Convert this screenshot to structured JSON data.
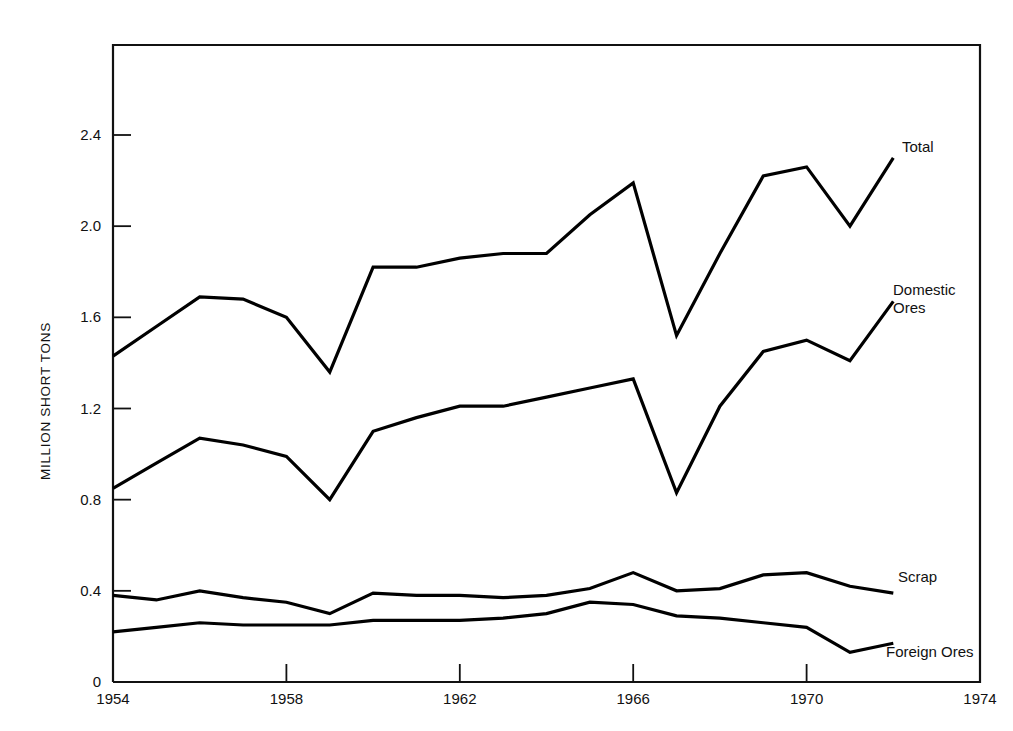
{
  "chart_data": {
    "type": "line",
    "title": "",
    "subtitle": "",
    "xlabel": "",
    "ylabel": "MILLION SHORT TONS",
    "xlim": [
      1954,
      1974
    ],
    "ylim": [
      0,
      2.65
    ],
    "grid": false,
    "legend_position": "right-inline",
    "x_ticks": [
      "1954",
      "1958",
      "1962",
      "1966",
      "1970",
      "1974"
    ],
    "x_tick_values": [
      1954,
      1958,
      1962,
      1966,
      1970,
      1974
    ],
    "y_ticks": [
      "0",
      "0.4",
      "0.8",
      "1.2",
      "1.6",
      "2.0",
      "2.4"
    ],
    "y_tick_values": [
      0,
      0.4,
      0.8,
      1.2,
      1.6,
      2.0,
      2.4
    ],
    "x": [
      1954,
      1955,
      1956,
      1957,
      1958,
      1959,
      1960,
      1961,
      1962,
      1963,
      1964,
      1965,
      1966,
      1967,
      1968,
      1969,
      1970,
      1971,
      1972
    ],
    "series": [
      {
        "name": "Total",
        "label": "Total",
        "color": "#000000",
        "values": [
          1.43,
          1.56,
          1.69,
          1.68,
          1.6,
          1.36,
          1.82,
          1.82,
          1.86,
          1.88,
          1.88,
          2.05,
          2.19,
          1.52,
          1.88,
          2.22,
          2.26,
          2.0,
          2.3
        ]
      },
      {
        "name": "Domestic Ores",
        "label": "Domestic\nOres",
        "color": "#000000",
        "values": [
          0.85,
          0.96,
          1.07,
          1.04,
          0.99,
          0.8,
          1.1,
          1.16,
          1.21,
          1.21,
          1.25,
          1.29,
          1.33,
          0.83,
          1.21,
          1.45,
          1.5,
          1.41,
          1.67
        ]
      },
      {
        "name": "Scrap",
        "label": "Scrap",
        "color": "#000000",
        "values": [
          0.38,
          0.36,
          0.4,
          0.37,
          0.35,
          0.3,
          0.39,
          0.38,
          0.38,
          0.37,
          0.38,
          0.41,
          0.48,
          0.4,
          0.41,
          0.47,
          0.48,
          0.42,
          0.39
        ]
      },
      {
        "name": "Foreign Ores",
        "label": "Foreign Ores",
        "color": "#000000",
        "values": [
          0.22,
          0.24,
          0.26,
          0.25,
          0.25,
          0.25,
          0.27,
          0.27,
          0.27,
          0.28,
          0.3,
          0.35,
          0.34,
          0.29,
          0.28,
          0.26,
          0.24,
          0.13,
          0.17
        ]
      }
    ],
    "series_label_anchors": [
      {
        "name": "Total",
        "x": 902,
        "y": 152
      },
      {
        "name": "Domestic Ores",
        "x": 893,
        "y": 295
      },
      {
        "name": "Scrap",
        "x": 898,
        "y": 582
      },
      {
        "name": "Foreign Ores",
        "x": 886,
        "y": 657
      }
    ],
    "frame": {
      "left": 113,
      "right": 980,
      "top": 45,
      "bottom": 682
    },
    "style": {
      "line_width": 3.2,
      "frame_width": 2.2,
      "axis_color": "#111111"
    }
  }
}
